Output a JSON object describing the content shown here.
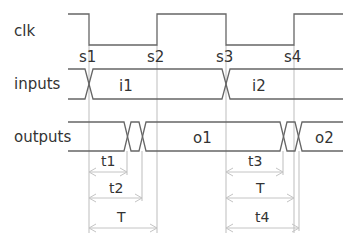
{
  "diagram": {
    "colors": {
      "text": "#333333",
      "waveform": "#666666",
      "guide": "#bdbdbd",
      "arrow": "#c4c4c4",
      "background": "#ffffff"
    },
    "signals": [
      {
        "name": "clk",
        "label": "clk"
      },
      {
        "name": "inputs",
        "label": "inputs",
        "values": [
          "i1",
          "i2"
        ]
      },
      {
        "name": "outputs",
        "label": "outputs",
        "values": [
          "o1",
          "o2"
        ]
      }
    ],
    "sample_points": [
      "s1",
      "s2",
      "s3",
      "s4"
    ],
    "intervals_left": [
      {
        "label": "t1",
        "from": "s1",
        "to": "output change start (first)"
      },
      {
        "label": "t2",
        "from": "s1",
        "to": "output stable (o1)"
      },
      {
        "label": "T",
        "from": "s1",
        "to": "s2"
      }
    ],
    "intervals_right": [
      {
        "label": "t3",
        "from": "s3",
        "to": "output change start (second)"
      },
      {
        "label": "T",
        "from": "s3",
        "to": "s4"
      },
      {
        "label": "t4",
        "from": "s3",
        "to": "output stable (o2)"
      }
    ]
  }
}
